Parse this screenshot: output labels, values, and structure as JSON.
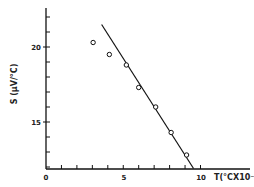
{
  "chart_data": {
    "type": "scatter",
    "title": "",
    "xlabel": "T(°CX10⁻²)",
    "ylabel": "S (μV/°C)",
    "xlim": [
      0,
      10.5
    ],
    "ylim": [
      11.9,
      22.6
    ],
    "x_ticks": [
      0,
      1,
      2,
      3,
      4,
      5,
      6,
      7,
      8,
      9,
      10
    ],
    "x_tick_labels": [
      "0",
      "5",
      "10"
    ],
    "y_ticks": [
      12,
      13,
      14,
      15,
      16,
      17,
      18,
      19,
      20,
      21,
      22
    ],
    "y_tick_labels": [
      "15",
      "20"
    ],
    "grid": false,
    "legend": null,
    "series": [
      {
        "name": "measured",
        "marker": "open-circle",
        "x": [
          3.05,
          4.1,
          5.2,
          6.0,
          7.1,
          8.1,
          9.1
        ],
        "y": [
          20.3,
          19.5,
          18.8,
          17.3,
          16.0,
          14.3,
          12.8
        ]
      },
      {
        "name": "linear fit",
        "style": "line",
        "x": [
          3.6,
          9.55
        ],
        "y": [
          21.5,
          11.9
        ]
      }
    ]
  },
  "axes": {
    "x_label": "T(°CX10⁻",
    "y_label": "S (μV/°C)",
    "x_label_0": "0",
    "x_label_5": "5",
    "x_label_10": "10",
    "y_label_15": "15",
    "y_label_20": "20"
  }
}
